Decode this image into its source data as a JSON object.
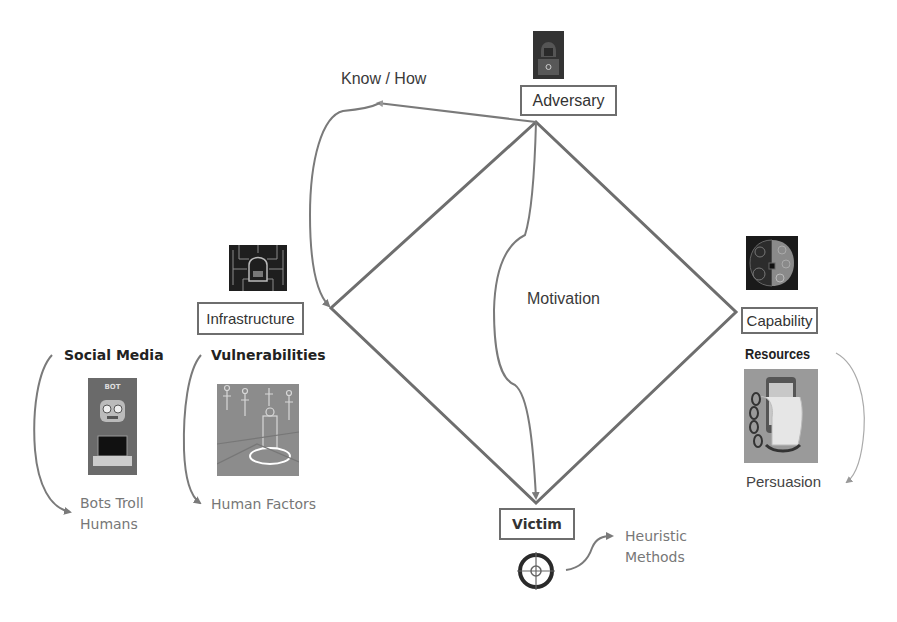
{
  "diagram": {
    "center_label": "Motivation",
    "know_how_label": "Know / How",
    "vertices": {
      "adversary": {
        "label": "Adversary",
        "icon": "hooded-hacker-icon"
      },
      "infrastructure": {
        "label": "Infrastructure",
        "icon": "circuit-lock-icon"
      },
      "capability": {
        "label": "Capability",
        "icon": "brain-circuit-icon"
      },
      "victim": {
        "label": "Victim",
        "icon": "crosshair-target-icon"
      }
    },
    "side_groups": {
      "social_media": {
        "heading": "Social Media",
        "icon": "bot-laptop-icon",
        "icon_caption": "BOT",
        "result_line1": "Bots Troll",
        "result_line2": "Humans"
      },
      "vulnerabilities": {
        "heading": "Vulnerabilities",
        "icon": "networked-people-icon",
        "result": "Human Factors"
      },
      "resources": {
        "heading": "Resources",
        "icon": "chained-phone-icon",
        "result": "Persuasion"
      },
      "victim_methods": {
        "result_line1": "Heuristic",
        "result_line2": "Methods"
      }
    },
    "colors": {
      "diamond_stroke": "#6e6e6e",
      "arrow_stroke": "#7a7a7a",
      "text": "#333333",
      "muted_text": "#777777"
    }
  }
}
